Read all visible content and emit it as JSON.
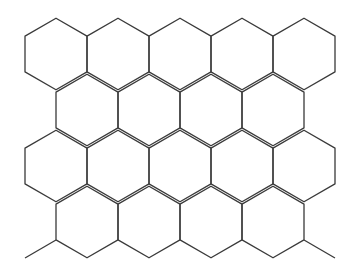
{
  "diagram": {
    "type": "hexagonal-grid",
    "orientation": "pointy-top",
    "stroke_color": "#3a3a3a",
    "background": "#ffffff",
    "stroke_width": 1.3,
    "hex_width": 62,
    "row_pitch": 56,
    "rows": [
      {
        "index": 0,
        "centers_x": [
          56,
          118,
          180,
          242,
          304
        ],
        "center_y": 54
      },
      {
        "index": 1,
        "centers_x": [
          87,
          149,
          211,
          273
        ],
        "center_y": 110
      },
      {
        "index": 2,
        "centers_x": [
          56,
          118,
          180,
          242,
          304
        ],
        "center_y": 166
      },
      {
        "index": 3,
        "centers_x": [
          87,
          149,
          211,
          273
        ],
        "center_y": 222
      }
    ],
    "bottom_stubs": [
      {
        "x1": 56,
        "y1": 240,
        "x2": 25,
        "y2": 258
      },
      {
        "x1": 304,
        "y1": 240,
        "x2": 335,
        "y2": 258
      }
    ]
  }
}
